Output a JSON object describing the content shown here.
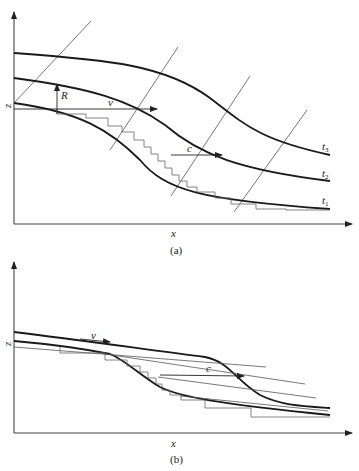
{
  "figure": {
    "panel_a": {
      "caption": "(a)",
      "x_axis_label": "x",
      "y_axis_label": "z",
      "curves": [
        {
          "name": "t",
          "sub": "1"
        },
        {
          "name": "t",
          "sub": "2"
        },
        {
          "name": "t",
          "sub": "3"
        }
      ],
      "labels": {
        "R": "R",
        "v": "v",
        "c": "c"
      }
    },
    "panel_b": {
      "caption": "(b)",
      "x_axis_label": "x",
      "y_axis_label": "z",
      "labels": {
        "v": "v",
        "c": "c"
      }
    }
  }
}
